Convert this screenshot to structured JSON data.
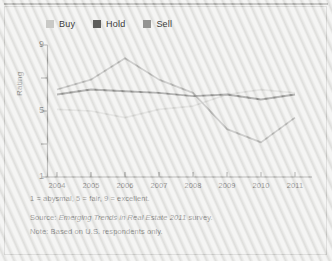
{
  "figure": {
    "background_color": "#e9e9e7",
    "border_color": "#b9b9b6"
  },
  "legend": {
    "position": "top-left",
    "items": [
      {
        "label": "Buy",
        "color": "#c9c9c6",
        "icon": "square-swatch-icon"
      },
      {
        "label": "Hold",
        "color": "#5d5d5b",
        "icon": "square-swatch-icon"
      },
      {
        "label": "Sell",
        "color": "#949492",
        "icon": "square-swatch-icon"
      }
    ]
  },
  "axes": {
    "y_title": "Rating",
    "y_tick_labels": [
      "9",
      "5",
      "1"
    ],
    "y_minor_ticks": [
      "7",
      "3"
    ],
    "x_tick_labels": [
      "2004",
      "2005",
      "2006",
      "2007",
      "2008",
      "2009",
      "2010",
      "2011"
    ]
  },
  "footnotes": {
    "scale": "1 = abysmal, 5 = fair, 9 = excellent.",
    "source_prefix": "Source: ",
    "source_title": "Emerging Trends in Real Estate 2011",
    "source_suffix": " survey.",
    "note": "Note: Based on U.S. respondents only."
  },
  "chart_data": {
    "type": "line",
    "title": "",
    "xlabel": "",
    "ylabel": "Rating",
    "categories": [
      "2004",
      "2005",
      "2006",
      "2007",
      "2008",
      "2009",
      "2010",
      "2011"
    ],
    "ylim": [
      1,
      9
    ],
    "yticks": [
      1,
      3,
      5,
      7,
      9
    ],
    "grid": false,
    "legend_position": "top-left",
    "annotations": [
      "1 = abysmal, 5 = fair, 9 = excellent.",
      "Source: Emerging Trends in Real Estate 2011 survey.",
      "Note: Based on U.S. respondents only."
    ],
    "series": [
      {
        "name": "Buy",
        "color": "#c9c9c6",
        "values": [
          5.1,
          5.0,
          4.6,
          5.1,
          5.3,
          6.0,
          6.3,
          6.1
        ]
      },
      {
        "name": "Hold",
        "color": "#5d5d5b",
        "values": [
          6.0,
          6.3,
          6.2,
          6.1,
          5.9,
          6.0,
          5.7,
          6.0
        ]
      },
      {
        "name": "Sell",
        "color": "#949492",
        "values": [
          6.3,
          6.9,
          8.2,
          6.9,
          6.1,
          3.9,
          3.1,
          4.6
        ]
      }
    ]
  }
}
